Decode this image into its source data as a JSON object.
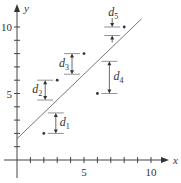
{
  "chart_data": {
    "type": "scatter",
    "title": "",
    "xlabel": "x",
    "ylabel": "y",
    "xlim": [
      0,
      10.5
    ],
    "ylim": [
      0,
      11
    ],
    "x_ticks": [
      1,
      2,
      3,
      4,
      5,
      6,
      7,
      8,
      9,
      10
    ],
    "y_ticks": [
      1,
      2,
      3,
      4,
      5,
      6,
      7,
      8,
      9,
      10
    ],
    "x_tick_labels": {
      "5": "5",
      "10": "10"
    },
    "y_tick_labels": {
      "5": "5",
      "10": "10"
    },
    "grid": false,
    "points": [
      {
        "x": 2,
        "y": 2,
        "deviation_label": "d",
        "deviation_index": "1"
      },
      {
        "x": 3,
        "y": 6,
        "deviation_label": "d",
        "deviation_index": "2"
      },
      {
        "x": 5,
        "y": 8,
        "deviation_label": "d",
        "deviation_index": "3"
      },
      {
        "x": 6,
        "y": 5,
        "deviation_label": "d",
        "deviation_index": "4"
      },
      {
        "x": 8,
        "y": 10,
        "deviation_label": "d",
        "deviation_index": "5"
      }
    ],
    "fit_line": {
      "slope": 0.97,
      "intercept": 1.6,
      "x_start": 0,
      "x_end": 9.3,
      "color": "#777777"
    },
    "annotations": [
      "d1",
      "d2",
      "d3",
      "d4",
      "d5"
    ]
  },
  "labels": {
    "x_axis": "x",
    "y_axis": "y",
    "tick_5": "5",
    "tick_10": "10"
  }
}
